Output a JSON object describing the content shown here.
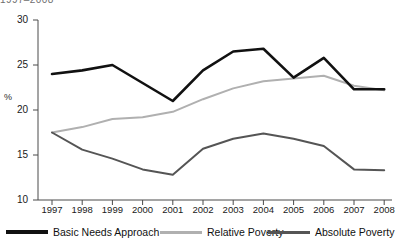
{
  "title_clipped": "1997–2008",
  "axis": {
    "ylabel": "%",
    "yticks": [
      "30",
      "25",
      "20",
      "15",
      "10"
    ],
    "xticks": [
      "1997",
      "1998",
      "1999",
      "2000",
      "2001",
      "2002",
      "2003",
      "2004",
      "2005",
      "2006",
      "2007",
      "2008"
    ]
  },
  "legend": [
    {
      "label": "Basic Needs Approach",
      "color": "#111111"
    },
    {
      "label": "Relative Poverty",
      "color": "#b0b0b0"
    },
    {
      "label": "Absolute Poverty",
      "color": "#555555"
    }
  ],
  "chart_data": {
    "type": "line",
    "title": "1997–2008",
    "xlabel": "",
    "ylabel": "%",
    "grid": false,
    "legend_position": "bottom",
    "ylim": [
      10,
      30
    ],
    "yticks": [
      10,
      15,
      20,
      25,
      30
    ],
    "categories": [
      "1997",
      "1998",
      "1999",
      "2000",
      "2001",
      "2002",
      "2003",
      "2004",
      "2005",
      "2006",
      "2007",
      "2008"
    ],
    "x": [
      1997,
      1998,
      1999,
      2000,
      2001,
      2002,
      2003,
      2004,
      2005,
      2006,
      2007,
      2008
    ],
    "series": [
      {
        "name": "Basic Needs Approach",
        "color": "#111111",
        "values": [
          24.0,
          24.4,
          25.0,
          23.0,
          21.0,
          24.4,
          26.5,
          26.8,
          23.6,
          25.8,
          22.3,
          22.3
        ]
      },
      {
        "name": "Relative Poverty",
        "color": "#b0b0b0",
        "values": [
          17.5,
          18.1,
          19.0,
          19.2,
          19.8,
          21.2,
          22.4,
          23.2,
          23.5,
          23.8,
          22.7,
          22.2
        ]
      },
      {
        "name": "Absolute Poverty",
        "color": "#555555",
        "values": [
          17.5,
          15.6,
          14.6,
          13.4,
          12.8,
          15.7,
          16.8,
          17.4,
          16.8,
          16.0,
          13.4,
          13.3
        ]
      }
    ]
  }
}
